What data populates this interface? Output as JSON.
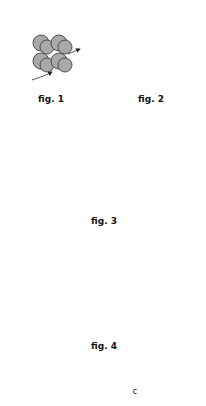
{
  "figures": [
    {
      "label": "fig. 1"
    },
    {
      "label": "fig. 2"
    },
    {
      "label": "fig. 3"
    },
    {
      "label": "fig. 4"
    },
    {
      "label": "",
      "annotation": "c"
    }
  ],
  "colors": {
    "dark_bead": "#6a6a6a",
    "mid_bead": "#a9a9a9",
    "light_bead": "#dcdcdc",
    "outline": "#333333"
  }
}
